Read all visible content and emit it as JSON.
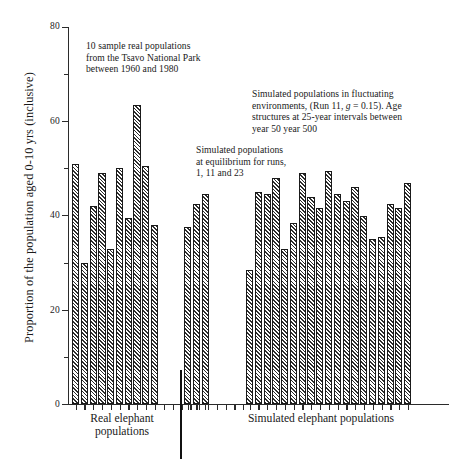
{
  "chart_data": {
    "type": "bar",
    "title": "",
    "xlabel": "",
    "ylabel": "Proportion of the population aged 0-10 yrs (inclusive)",
    "ylim": [
      0,
      80
    ],
    "ytick_major": [
      0,
      20,
      40,
      60,
      80
    ],
    "ytick_minor": [
      10,
      30,
      50,
      70
    ],
    "grid": false,
    "legend": "none",
    "groups": [
      {
        "name": "Real elephant populations",
        "caption": "Real elephant\npopulations",
        "annotation": "10 sample real populations from the Tsavo National Park between 1960 and 1980",
        "values": [
          51,
          30,
          42,
          49,
          33,
          50,
          39.5,
          63.5,
          50.5,
          38
        ]
      },
      {
        "name": "Simulated populations at equilibrium",
        "annotation": "Simulated populations at equilibrium for runs, 1, 11 and 23",
        "values": [
          37.5,
          42.5,
          44.5
        ]
      },
      {
        "name": "Simulated populations in fluctuating environments",
        "annotation": "Simulated populations in fluctuating environments, (Run 11, g = 0.15). Age structures at 25-year intervals between year 50 year 500",
        "values": [
          28.5,
          45,
          44.5,
          48,
          33,
          38.5,
          49,
          44,
          41.5,
          49.5,
          44.5,
          43,
          46,
          40,
          35,
          35.5,
          42.5,
          41.5,
          47
        ]
      }
    ],
    "x_group_captions": [
      "Real elephant populations",
      "Simulated elephant populations"
    ]
  },
  "axis": {
    "y_title": "Proportion of the population aged 0-10 yrs (inclusive)",
    "y_labels": [
      "80",
      "60",
      "40",
      "20",
      "0"
    ]
  },
  "annotations": {
    "real": {
      "line1": "10 sample real populations",
      "line2": "from the Tsavo National Park",
      "line3": "between 1960 and 1980"
    },
    "equilibrium": {
      "line1": "Simulated populations",
      "line2": "at equilibrium for runs,",
      "line3": "1, 11 and 23"
    },
    "fluctuating": {
      "line1": "Simulated populations in fluctuating",
      "line2_a": "environments, (Run 11, ",
      "line2_italic": "g",
      "line2_b": " = 0.15). Age",
      "line3": "structures at 25-year intervals between",
      "line4": "year 50 year 500"
    }
  },
  "captions": {
    "real_line1": "Real elephant",
    "real_line2": "populations",
    "simulated": "Simulated elephant populations"
  },
  "colors": {
    "ink": "#1a1a1a",
    "hatch": "#2d2d2d",
    "background": "#ffffff"
  }
}
